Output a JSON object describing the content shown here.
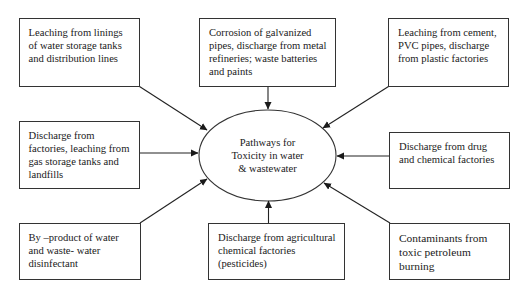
{
  "diagram": {
    "center": {
      "label": "Pathways for\nToxicity in water\n& wastewater",
      "shape": "ellipse"
    },
    "sources": [
      {
        "id": "top-left",
        "label": "Leaching from linings of water storage tanks and distribution lines"
      },
      {
        "id": "top-center",
        "label": "Corrosion of galvanized pipes, discharge from metal refineries; waste batteries and paints"
      },
      {
        "id": "top-right",
        "label": "Leaching from cement, PVC pipes, discharge from plastic factories"
      },
      {
        "id": "middle-left",
        "label": "Discharge from factories, leaching from gas storage tanks and landfills"
      },
      {
        "id": "middle-right",
        "label": "Discharge from drug and chemical factories"
      },
      {
        "id": "bottom-left",
        "label": "By –product of water and waste- water disinfectant"
      },
      {
        "id": "bottom-center",
        "label": "Discharge from agricultural chemical factories (pesticides)"
      },
      {
        "id": "bottom-right",
        "label": "Contaminants from toxic petroleum burning"
      }
    ],
    "edges": [
      {
        "from": "top-left",
        "to": "center"
      },
      {
        "from": "top-center",
        "to": "center"
      },
      {
        "from": "top-right",
        "to": "center"
      },
      {
        "from": "middle-left",
        "to": "center"
      },
      {
        "from": "middle-right",
        "to": "center"
      },
      {
        "from": "bottom-left",
        "to": "center"
      },
      {
        "from": "bottom-center",
        "to": "center"
      },
      {
        "from": "bottom-right",
        "to": "center"
      }
    ],
    "colors": {
      "stroke": "#333333",
      "background": "#ffffff",
      "text": "#1a1a1a"
    }
  }
}
